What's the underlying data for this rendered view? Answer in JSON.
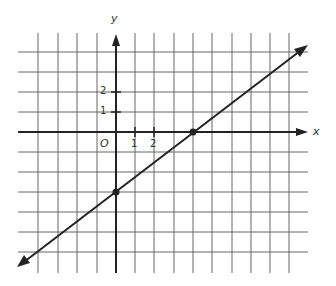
{
  "figure": {
    "type": "coordinate-graph",
    "axis_labels": {
      "x": "x",
      "y": "y",
      "origin": "O"
    },
    "x_ticks": [
      {
        "value": 1,
        "label": "1"
      },
      {
        "value": 2,
        "label": "2"
      }
    ],
    "y_ticks": [
      {
        "value": 1,
        "label": "1"
      },
      {
        "value": 2,
        "label": "2"
      }
    ],
    "grid": {
      "x_range": [
        -4,
        9
      ],
      "y_range": [
        -7,
        4
      ],
      "unit": 1
    },
    "line": {
      "description": "straight line through two marked points, arrows at both ends",
      "points": [
        {
          "x": 0,
          "y": -3
        },
        {
          "x": 4,
          "y": 0
        }
      ],
      "slope": 0.75,
      "y_intercept": -3,
      "x_intercept": 4
    },
    "colors": {
      "grid": "#555555",
      "axis": "#222222",
      "line": "#222222",
      "background": "#ffffff"
    }
  }
}
